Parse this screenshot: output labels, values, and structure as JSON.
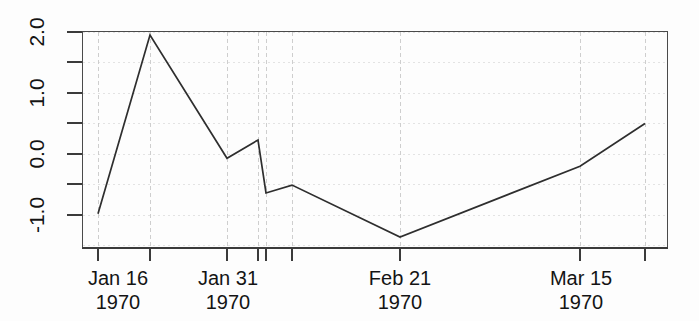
{
  "chart_data": {
    "type": "line",
    "title": "",
    "xlabel": "",
    "ylabel": "",
    "grid": true,
    "legend": null,
    "xlim": [
      "1970-01-14",
      "1970-03-24"
    ],
    "ylim": [
      -1.6,
      2.1
    ],
    "y_axis": {
      "labels": [
        "2.0",
        "1.0",
        "0.0",
        "-1.0"
      ],
      "label_values": [
        2.0,
        1.0,
        0.0,
        -1.0
      ],
      "minor_tick_values": [
        1.5,
        0.5,
        -0.5
      ],
      "all_tick_values": [
        2.0,
        1.5,
        1.0,
        0.5,
        0.0,
        -0.5,
        -1.0
      ]
    },
    "x_axis": {
      "tick_labels": [
        {
          "line1": "Jan 16",
          "line2": "1970"
        },
        {
          "line1": "Jan 31",
          "line2": "1970"
        },
        {
          "line1": "Feb 21",
          "line2": "1970"
        },
        {
          "line1": "Mar 15",
          "line2": "1970"
        }
      ],
      "tick_dates": [
        "1970-01-16",
        "1970-01-31",
        "1970-02-21",
        "1970-03-15"
      ],
      "untick_labeled_dates": [
        "1970-01-22",
        "1970-02-04",
        "1970-02-05",
        "1970-02-08"
      ]
    },
    "series": [
      {
        "name": "series-1",
        "color": "#2e2e2e",
        "x": [
          "1970-01-16",
          "1970-01-22",
          "1970-01-31",
          "1970-02-04",
          "1970-02-05",
          "1970-02-08",
          "1970-02-21",
          "1970-03-15",
          "1970-03-23"
        ],
        "y": [
          -0.98,
          1.95,
          -0.07,
          0.23,
          -0.64,
          -0.51,
          -1.36,
          -0.2,
          0.5
        ]
      }
    ],
    "points": [
      {
        "date": "1970-01-16",
        "value": -0.98
      },
      {
        "date": "1970-01-22",
        "value": 1.95
      },
      {
        "date": "1970-01-31",
        "value": -0.07
      },
      {
        "date": "1970-02-04",
        "value": 0.23
      },
      {
        "date": "1970-02-05",
        "value": -0.64
      },
      {
        "date": "1970-02-08",
        "value": -0.51
      },
      {
        "date": "1970-02-21",
        "value": -1.36
      },
      {
        "date": "1970-03-15",
        "value": -0.2
      },
      {
        "date": "1970-03-23",
        "value": 0.5
      }
    ]
  },
  "figure": {
    "background_color": "#fdfdfd",
    "axis_color": "#3b3b3b",
    "line_color": "#2e2e2e",
    "grid_color": "#c9c9c9"
  },
  "y_tick_labels": {
    "t0": "2.0",
    "t1": "1.0",
    "t2": "0.0",
    "t3": "-1.0"
  },
  "x_tick_labels": {
    "c0_line1": "Jan 16",
    "c0_line2": "1970",
    "c1_line1": "Jan 31",
    "c1_line2": "1970",
    "c2_line1": "Feb 21",
    "c2_line2": "1970",
    "c3_line1": "Mar 15",
    "c3_line2": "1970"
  }
}
